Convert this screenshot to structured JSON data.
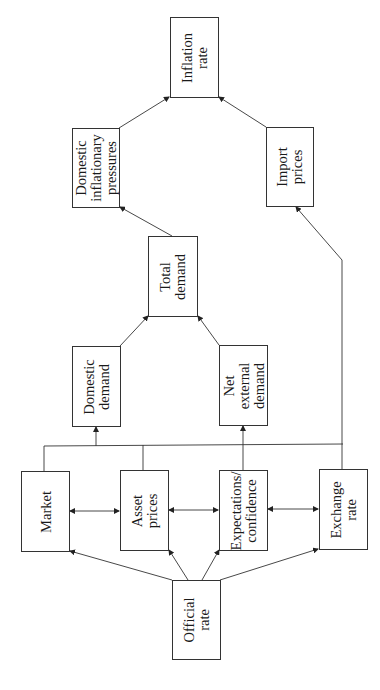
{
  "diagram": {
    "orientation": "rotated-90-ccw",
    "nodes": {
      "official_rate": "Official\nrate",
      "market": "Market",
      "asset_prices": "Asset\nprices",
      "expectations": "Expectations/\nconfidence",
      "exchange_rate": "Exchange\nrate",
      "domestic_demand": "Domestic\ndemand",
      "net_external_demand": "Net\nexternal\ndemand",
      "total_demand": "Total\ndemand",
      "domestic_inflationary_pressures": "Domestic\ninflationary\npressures",
      "import_prices": "Import\nprices",
      "inflation_rate": "Inflation\nrate"
    },
    "edges": [
      [
        "Official rate",
        "Market"
      ],
      [
        "Official rate",
        "Asset prices"
      ],
      [
        "Official rate",
        "Expectations/confidence"
      ],
      [
        "Official rate",
        "Exchange rate"
      ],
      [
        "Market",
        "Asset prices",
        "bidirectional"
      ],
      [
        "Asset prices",
        "Expectations/confidence",
        "bidirectional"
      ],
      [
        "Expectations/confidence",
        "Exchange rate",
        "bidirectional"
      ],
      [
        "Market/Asset prices/Exchange rate bus",
        "Domestic demand"
      ],
      [
        "Expectations/confidence",
        "Net external demand"
      ],
      [
        "Exchange rate",
        "Import prices"
      ],
      [
        "Domestic demand",
        "Total demand"
      ],
      [
        "Net external demand",
        "Total demand"
      ],
      [
        "Total demand",
        "Domestic inflationary pressures"
      ],
      [
        "Domestic inflationary pressures",
        "Inflation rate"
      ],
      [
        "Import prices",
        "Inflation rate"
      ]
    ]
  }
}
